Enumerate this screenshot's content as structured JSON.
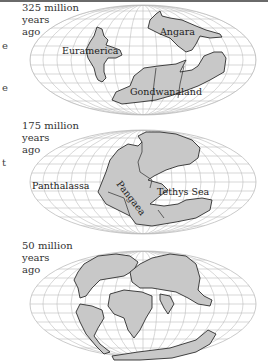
{
  "edge_fragments": [
    {
      "text": "e",
      "y": 43
    },
    {
      "text": "e",
      "y": 85
    },
    {
      "text": "t",
      "y": 160
    }
  ],
  "colors": {
    "land": "#c8c8c8",
    "coast": "#2e2e2e",
    "grid": "#bdbdbd",
    "background": "#ffffff"
  },
  "panels": [
    {
      "era": {
        "line1": "325 million",
        "line2": "years",
        "line3": "ago"
      },
      "labels": [
        {
          "text": "Euramerica",
          "x": 62,
          "y": 54
        },
        {
          "text": "Angara",
          "x": 160,
          "y": 35
        },
        {
          "text": "Gondwanaland",
          "x": 130,
          "y": 95
        }
      ]
    },
    {
      "era": {
        "line1": "175 million",
        "line2": "years",
        "line3": "ago"
      },
      "labels": [
        {
          "text": "Panthalassa",
          "x": 32,
          "y": 71
        },
        {
          "text": "Pangaea",
          "x": 116,
          "y": 66,
          "rotate": 52
        },
        {
          "text": "Tethys Sea",
          "x": 157,
          "y": 77
        }
      ]
    },
    {
      "era": {
        "line1": "50 million",
        "line2": "years",
        "line3": "ago"
      }
    }
  ]
}
